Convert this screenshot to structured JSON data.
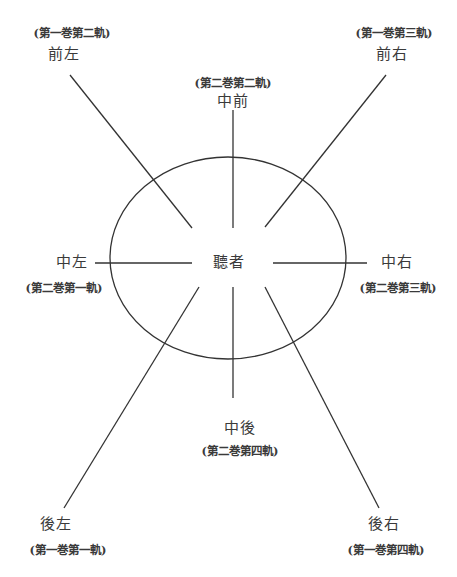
{
  "diagram": {
    "type": "speaker-layout",
    "stroke_color": "#333333",
    "center": {
      "label": "聽者",
      "x": 229,
      "y": 263
    },
    "ellipse": {
      "cx": 228,
      "cy": 258,
      "rx": 118,
      "ry": 101
    },
    "positions": [
      {
        "id": "front-left",
        "name": "前左",
        "track": "(第一巻第二軌)",
        "line": [
          70,
          75,
          192,
          228
        ]
      },
      {
        "id": "front-center",
        "name": "中前",
        "track": "(第二巻第二軌)",
        "line": [
          233,
          110,
          233,
          228
        ]
      },
      {
        "id": "front-right",
        "name": "前右",
        "track": "(第一巻第三軌)",
        "line": [
          386,
          75,
          265,
          227
        ]
      },
      {
        "id": "center-left",
        "name": "中左",
        "track": "(第二巻第一軌)",
        "line": [
          95,
          263,
          192,
          263
        ]
      },
      {
        "id": "center-right",
        "name": "中右",
        "track": "(第二巻第三軌)",
        "line": [
          273,
          263,
          367,
          263
        ]
      },
      {
        "id": "rear-center",
        "name": "中後",
        "track": "(第二巻第四軌)",
        "line": [
          233,
          287,
          233,
          398
        ]
      },
      {
        "id": "rear-left",
        "name": "後左",
        "track": "(第一巻第一軌)",
        "line": [
          199,
          287,
          64,
          508
        ]
      },
      {
        "id": "rear-right",
        "name": "後右",
        "track": "(第一巻第四軌)",
        "line": [
          265,
          287,
          379,
          508
        ]
      }
    ]
  }
}
